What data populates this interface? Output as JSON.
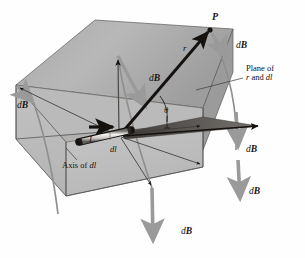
{
  "figure": {
    "background_color": "#fefefe",
    "ink_color": "#14110f",
    "field_arrow_color": "#9a9a9a",
    "plane_fill_top": "#b3b3b3",
    "plane_fill_bottom": "#c6c6c6",
    "plane_fill_left": "#bdbdbd",
    "wedge_color": "#55524f"
  },
  "labels": {
    "point_p": "P",
    "r_vector": "r",
    "current": "I",
    "dl_element": "dl",
    "theta": "θ",
    "plane_line1": "Plane of",
    "plane_line2_pre": "r",
    "plane_line2_mid": " and ",
    "plane_line2_post": "dl",
    "axis_pre": "Axis of ",
    "axis_post": "dl",
    "db_prefix": "d",
    "db_vector": "B"
  },
  "db_arrows": [
    {
      "id": "db-top-right",
      "label_d": "d",
      "label_b": "B",
      "position": "upper-right near P"
    },
    {
      "id": "db-middle",
      "label_d": "d",
      "label_b": "B",
      "position": "center above current element"
    },
    {
      "id": "db-left",
      "label_d": "d",
      "label_b": "B",
      "position": "left face"
    },
    {
      "id": "db-right-upper",
      "label_d": "d",
      "label_b": "B",
      "position": "right side upper"
    },
    {
      "id": "db-right-lower",
      "label_d": "d",
      "label_b": "B",
      "position": "right side lower"
    },
    {
      "id": "db-bottom",
      "label_d": "d",
      "label_b": "B",
      "position": "bottom center"
    }
  ]
}
